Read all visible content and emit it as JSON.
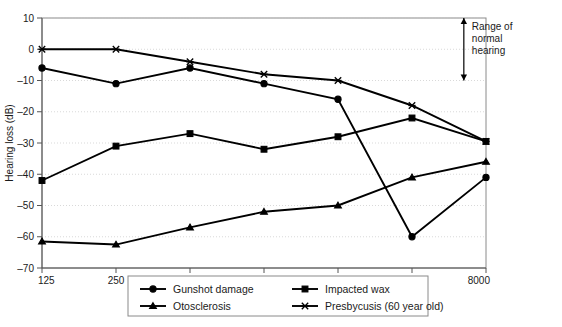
{
  "chart_data": {
    "type": "line",
    "title": "",
    "xlabel": "",
    "ylabel": "Hearing loss (dB)",
    "x": [
      125,
      250,
      500,
      1000,
      2000,
      4000,
      8000
    ],
    "xtick_labels": [
      "125",
      "250",
      "500",
      "1000",
      "2000",
      "4000",
      "8000"
    ],
    "x_scale": "log",
    "ytick_labels": [
      "10",
      "0",
      "-10",
      "-20",
      "-30",
      "-40",
      "-50",
      "-60",
      "-70"
    ],
    "yticks": [
      10,
      0,
      -10,
      -20,
      -30,
      -40,
      -50,
      -60,
      -70
    ],
    "ylim": [
      -70,
      10
    ],
    "grid": true,
    "legend_position": "below-axes",
    "series": [
      {
        "name": "Gunshot damage",
        "marker": "circle",
        "values": [
          -6,
          -11,
          -6,
          -11,
          -16,
          -60,
          -41
        ]
      },
      {
        "name": "Impacted wax",
        "marker": "square",
        "values": [
          -42,
          -31,
          -27,
          -32,
          -28,
          -22,
          -29.5
        ]
      },
      {
        "name": "Otosclerosis",
        "marker": "triangle",
        "values": [
          -61.5,
          -62.5,
          -57,
          -52,
          -50,
          -41,
          -36
        ]
      },
      {
        "name": "Presbycusis (60 year old)",
        "marker": "x",
        "values": [
          0,
          0,
          -4,
          -8,
          -10,
          -18,
          -29.5
        ]
      }
    ],
    "annotations": [
      {
        "text_lines": [
          "Range of",
          "normal",
          "hearing"
        ],
        "type": "double-arrow",
        "from_y": 10,
        "to_y": -10,
        "at_x": 6500
      }
    ]
  },
  "legend": {
    "entries": [
      {
        "label": "Gunshot damage",
        "marker": "circle"
      },
      {
        "label": "Impacted wax",
        "marker": "square"
      },
      {
        "label": "Otosclerosis",
        "marker": "triangle"
      },
      {
        "label": "Presbycusis (60 year old)",
        "marker": "x"
      }
    ]
  },
  "axes": {
    "y_title": "Hearing loss (dB)"
  },
  "caption": {
    "text": ""
  }
}
